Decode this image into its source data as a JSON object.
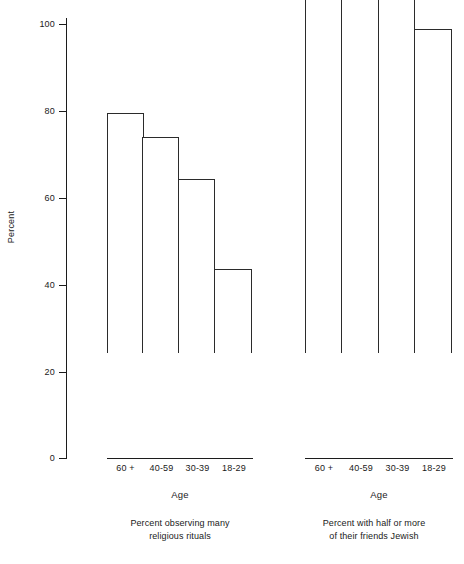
{
  "chart_data": [
    {
      "type": "bar",
      "title": "Percent observing many religious rituals",
      "xlabel": "Age",
      "ylabel": "Percent",
      "categories": [
        "60 +",
        "40-59",
        "30-39",
        "18-29"
      ],
      "values": [
        55.3,
        49.8,
        40.0,
        19.4
      ],
      "ylim": [
        0,
        100
      ],
      "yticks": [
        0,
        20,
        40,
        60,
        80,
        100
      ],
      "grid": false,
      "legend": "none",
      "bar_style": "adjacent-outline"
    },
    {
      "type": "bar",
      "title": "Percent with half or more of their friends Jewish",
      "xlabel": "Age",
      "ylabel": "Percent",
      "categories": [
        "60 +",
        "40-59",
        "30-39",
        "18-29"
      ],
      "values": [
        89.2,
        96.1,
        87.8,
        74.7
      ],
      "ylim": [
        0,
        100
      ],
      "yticks": [
        0,
        20,
        40,
        60,
        80,
        100
      ],
      "grid": false,
      "legend": "none",
      "bar_style": "adjacent-outline"
    }
  ],
  "axis": {
    "y_title": "Percent",
    "y_tick_labels": [
      "100",
      "80",
      "60",
      "40",
      "20",
      "0"
    ],
    "x_title_left": "Age",
    "x_title_right": "Age"
  },
  "panels": {
    "left": {
      "caption_line1": "Percent observing many",
      "caption_line2": "religious rituals",
      "x_labels": [
        "60 +",
        "40-59",
        "30-39",
        "18-29"
      ]
    },
    "right": {
      "caption_line1": "Percent with half or more",
      "caption_line2": "of their friends Jewish",
      "x_labels": [
        "60 +",
        "40-59",
        "30-39",
        "18-29"
      ]
    }
  },
  "colors": {
    "ink": "#1c1c1c",
    "bar_stroke": "#2b2b2b",
    "bar_fill": "#ffffff",
    "background": "#ffffff"
  }
}
